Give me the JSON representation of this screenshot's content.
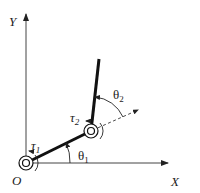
{
  "diagram": {
    "labels": {
      "x_axis": "X",
      "y_axis": "Y",
      "origin": "O",
      "theta1": "θ",
      "theta1_sub": "1",
      "theta2": "θ",
      "theta2_sub": "2",
      "tau1": "τ",
      "tau1_sub": "1",
      "tau2": "τ",
      "tau2_sub": "2"
    },
    "colors": {
      "line": "#111111",
      "axis": "#444444",
      "background": "#ffffff"
    }
  }
}
